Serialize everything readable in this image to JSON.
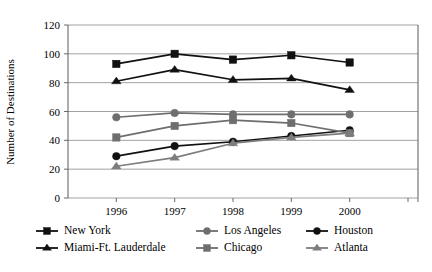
{
  "chart_data": {
    "type": "line",
    "title": "",
    "xlabel": "",
    "ylabel": "Number of Destinations",
    "categories": [
      "1996",
      "1997",
      "1998",
      "1999",
      "2000"
    ],
    "ylim": [
      0,
      120
    ],
    "ytick_values": [
      0,
      20,
      40,
      60,
      80,
      100,
      120
    ],
    "ytick_labels": [
      "0",
      "20",
      "40",
      "60",
      "80",
      "100",
      "120"
    ],
    "grid": true,
    "legend_position": "bottom",
    "series": [
      {
        "name": "New York",
        "values": [
          93,
          100,
          96,
          99,
          94
        ],
        "color": "#111111",
        "marker": "square"
      },
      {
        "name": "Los Angeles",
        "values": [
          56,
          59,
          58,
          58,
          58
        ],
        "color": "#6e6e6e",
        "marker": "circle"
      },
      {
        "name": "Houston",
        "values": [
          29,
          36,
          39,
          43,
          47
        ],
        "color": "#111111",
        "marker": "circle"
      },
      {
        "name": "Miami-Ft. Lauderdale",
        "values": [
          81,
          89,
          82,
          83,
          75
        ],
        "color": "#111111",
        "marker": "triangle"
      },
      {
        "name": "Chicago",
        "values": [
          42,
          50,
          54,
          52,
          45
        ],
        "color": "#6e6e6e",
        "marker": "square"
      },
      {
        "name": "Atlanta",
        "values": [
          22,
          28,
          38,
          42,
          45
        ],
        "color": "#7d7d7d",
        "marker": "triangle"
      }
    ]
  },
  "legend": {
    "entries": [
      {
        "label": "New York"
      },
      {
        "label": "Los Angeles"
      },
      {
        "label": "Houston"
      },
      {
        "label": "Miami-Ft. Lauderdale"
      },
      {
        "label": "Chicago"
      },
      {
        "label": "Atlanta"
      }
    ]
  },
  "caption": {
    "text": ""
  }
}
